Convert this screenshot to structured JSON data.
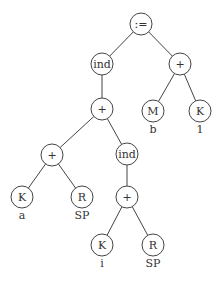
{
  "diagram": {
    "type": "syntax-tree",
    "nodes": [
      {
        "id": "assign",
        "label": ":=",
        "x": 141,
        "y": 24,
        "sub": ""
      },
      {
        "id": "ind1",
        "label": "ind",
        "x": 102,
        "y": 64,
        "sub": ""
      },
      {
        "id": "plus_r",
        "label": "+",
        "x": 180,
        "y": 64,
        "sub": ""
      },
      {
        "id": "M",
        "label": "M",
        "x": 153,
        "y": 111,
        "sub": "b"
      },
      {
        "id": "K1",
        "label": "K",
        "x": 200,
        "y": 111,
        "sub": "1"
      },
      {
        "id": "plus_m",
        "label": "+",
        "x": 102,
        "y": 109,
        "sub": ""
      },
      {
        "id": "plus_l",
        "label": "+",
        "x": 52,
        "y": 155,
        "sub": ""
      },
      {
        "id": "ind2",
        "label": "ind",
        "x": 127,
        "y": 154,
        "sub": ""
      },
      {
        "id": "Ka",
        "label": "K",
        "x": 22,
        "y": 197,
        "sub": "a"
      },
      {
        "id": "R1",
        "label": "R",
        "x": 82,
        "y": 197,
        "sub": "SP"
      },
      {
        "id": "plus_b",
        "label": "+",
        "x": 127,
        "y": 197,
        "sub": ""
      },
      {
        "id": "Ki",
        "label": "K",
        "x": 102,
        "y": 245,
        "sub": "i"
      },
      {
        "id": "R2",
        "label": "R",
        "x": 153,
        "y": 245,
        "sub": "SP"
      }
    ],
    "edges": [
      [
        "assign",
        "ind1"
      ],
      [
        "assign",
        "plus_r"
      ],
      [
        "plus_r",
        "M"
      ],
      [
        "plus_r",
        "K1"
      ],
      [
        "ind1",
        "plus_m"
      ],
      [
        "plus_m",
        "plus_l"
      ],
      [
        "plus_m",
        "ind2"
      ],
      [
        "plus_l",
        "Ka"
      ],
      [
        "plus_l",
        "R1"
      ],
      [
        "ind2",
        "plus_b"
      ],
      [
        "plus_b",
        "Ki"
      ],
      [
        "plus_b",
        "R2"
      ]
    ],
    "node_radius": 11
  }
}
